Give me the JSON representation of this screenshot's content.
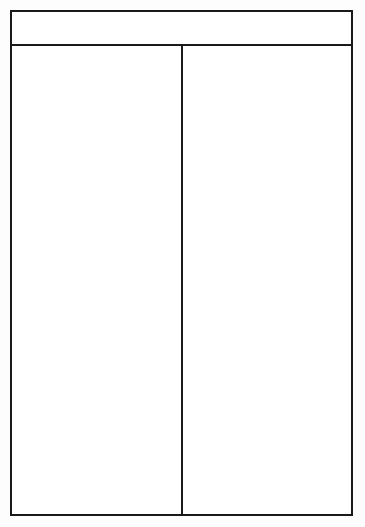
{
  "diagram": {
    "type": "t-chart",
    "title": "",
    "columns": [
      {
        "heading": "",
        "items": []
      },
      {
        "heading": "",
        "items": []
      }
    ],
    "colors": {
      "line": "#1a1a1a",
      "background": "#ffffff"
    }
  }
}
